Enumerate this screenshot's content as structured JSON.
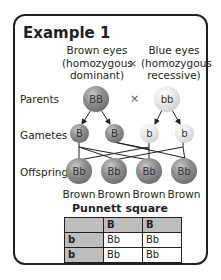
{
  "title": "Example 1",
  "parents_header": {
    "left": [
      "Brown eyes",
      "(homozygous",
      "dominant)"
    ],
    "cross": "×",
    "right": [
      "Blue eyes",
      "(homozygous",
      "recessive)"
    ]
  },
  "row_labels": {
    "parents": "Parents",
    "gametes": "Gametes",
    "offspring": "Offspring"
  },
  "parents": {
    "left": "BB",
    "cross": "×",
    "right": "bb"
  },
  "gametes": [
    "B",
    "B",
    "b",
    "b"
  ],
  "offspring": [
    {
      "genotype": "Bb",
      "phenotype": "Brown"
    },
    {
      "genotype": "Bb",
      "phenotype": "Brown"
    },
    {
      "genotype": "Bb",
      "phenotype": "Brown"
    },
    {
      "genotype": "Bb",
      "phenotype": "Brown"
    }
  ],
  "punnett": {
    "title": "Punnett square",
    "col_headers": [
      "B",
      "B"
    ],
    "rows": [
      {
        "header": "b",
        "cells": [
          "Bb",
          "Bb"
        ]
      },
      {
        "header": "b",
        "cells": [
          "Bb",
          "Bb"
        ]
      }
    ]
  },
  "colors": {
    "dominant": "#7a7a7a",
    "recessive": "#e0e0e0",
    "border": "#231f20",
    "table_header": "#bdbdbd"
  }
}
